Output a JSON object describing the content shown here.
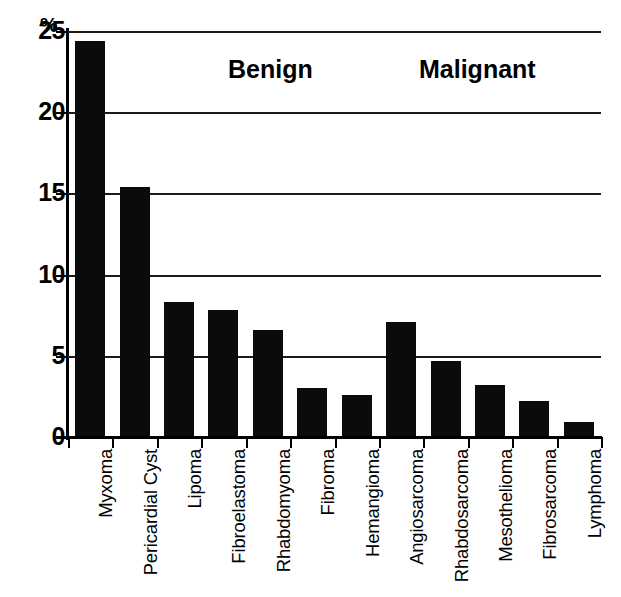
{
  "chart_data": {
    "type": "bar",
    "title": "",
    "subtitle": "",
    "xlabel": "",
    "ylabel": "%",
    "ylim": [
      0,
      25
    ],
    "yticks": [
      0,
      5,
      10,
      15,
      20,
      25
    ],
    "ytick_labels": [
      "0",
      "5",
      "10",
      "15",
      "20",
      "25"
    ],
    "grid": true,
    "grid_axis": "y",
    "legend": "none",
    "bar_color": "#0b0b0b",
    "categories": [
      "Myxoma",
      "Pericardial Cyst",
      "Lipoma",
      "Fibroelastoma",
      "Rhabdomyoma",
      "Fibroma",
      "Hemangioma",
      "Angiosarcoma",
      "Rhabdosarcoma",
      "Mesothelioma",
      "Fibrosarcoma",
      "Lymphoma"
    ],
    "values": [
      24.4,
      15.4,
      8.3,
      7.8,
      6.6,
      3.0,
      2.6,
      7.1,
      4.7,
      3.2,
      2.2,
      0.9
    ],
    "annotations": [
      {
        "text": "Benign",
        "group_indices": [
          0,
          1,
          2,
          3,
          4,
          5,
          6
        ]
      },
      {
        "text": "Malignant",
        "group_indices": [
          7,
          8,
          9,
          10,
          11
        ]
      }
    ]
  },
  "axis": {
    "percent_symbol": "%"
  }
}
